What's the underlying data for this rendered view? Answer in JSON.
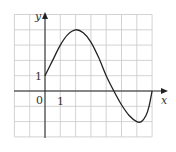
{
  "chart_data": {
    "type": "line",
    "title": "",
    "xlabel": "x",
    "ylabel": "y",
    "xlim": [
      -2,
      8
    ],
    "ylim": [
      -3,
      5
    ],
    "grid": true,
    "tick_labels": {
      "origin": "0",
      "x_one": "1",
      "y_one": "1"
    },
    "series": [
      {
        "name": "f(x)",
        "x": [
          0,
          0.5,
          1,
          1.5,
          2,
          2.5,
          3,
          3.5,
          4,
          4.5,
          5,
          5.5,
          6,
          6.3,
          6.6,
          6.8,
          7
        ],
        "y": [
          1,
          2.0,
          3.0,
          3.7,
          4.0,
          3.8,
          3.2,
          2.2,
          1.0,
          0,
          -0.9,
          -1.6,
          -2.0,
          -2.0,
          -1.6,
          -1.0,
          0
        ]
      }
    ]
  },
  "colors": {
    "grid": "#c8c8c8",
    "axis": "#222222",
    "curve": "#222222"
  }
}
